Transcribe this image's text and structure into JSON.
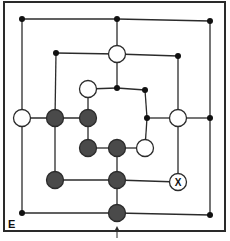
{
  "game": {
    "name": "Nine Men's Morris",
    "corner_label": "E",
    "colors": {
      "line": "#2b2b2b",
      "dark_piece": "#4a4a4a",
      "light_piece": "#ffffff",
      "dot": "#111111",
      "frame": "#2a2a2a"
    },
    "points": [
      {
        "id": "o-tl",
        "x": 22,
        "y": 19,
        "state": "dot"
      },
      {
        "id": "o-tm",
        "x": 117,
        "y": 19,
        "state": "dot"
      },
      {
        "id": "o-tr",
        "x": 210,
        "y": 21,
        "state": "dot"
      },
      {
        "id": "o-ml",
        "x": 22,
        "y": 118,
        "state": "white"
      },
      {
        "id": "o-mr",
        "x": 210,
        "y": 118,
        "state": "dot"
      },
      {
        "id": "o-bl",
        "x": 22,
        "y": 213,
        "state": "dot"
      },
      {
        "id": "o-bm",
        "x": 117,
        "y": 213,
        "state": "black"
      },
      {
        "id": "o-br",
        "x": 210,
        "y": 215,
        "state": "dot"
      },
      {
        "id": "m-tl",
        "x": 56,
        "y": 53,
        "state": "dot"
      },
      {
        "id": "m-tm",
        "x": 117,
        "y": 54,
        "state": "white"
      },
      {
        "id": "m-tr",
        "x": 178,
        "y": 56,
        "state": "dot"
      },
      {
        "id": "m-ml",
        "x": 55,
        "y": 118,
        "state": "black"
      },
      {
        "id": "m-mr",
        "x": 178,
        "y": 118,
        "state": "white"
      },
      {
        "id": "m-bl",
        "x": 55,
        "y": 180,
        "state": "black"
      },
      {
        "id": "m-bm",
        "x": 117,
        "y": 180,
        "state": "black"
      },
      {
        "id": "m-br",
        "x": 178,
        "y": 182,
        "state": "target",
        "mark": "X"
      },
      {
        "id": "i-tl",
        "x": 88,
        "y": 89,
        "state": "white"
      },
      {
        "id": "i-tm",
        "x": 117,
        "y": 88,
        "state": "dot"
      },
      {
        "id": "i-tr",
        "x": 145,
        "y": 90,
        "state": "dot"
      },
      {
        "id": "i-ml",
        "x": 88,
        "y": 118,
        "state": "black"
      },
      {
        "id": "i-mr",
        "x": 147,
        "y": 118,
        "state": "dot"
      },
      {
        "id": "i-bl",
        "x": 88,
        "y": 148,
        "state": "black"
      },
      {
        "id": "i-bm",
        "x": 117,
        "y": 148,
        "state": "black"
      },
      {
        "id": "i-br",
        "x": 145,
        "y": 148,
        "state": "white"
      }
    ],
    "lines": [
      [
        "o-tl",
        "o-tm"
      ],
      [
        "o-tm",
        "o-tr"
      ],
      [
        "o-tr",
        "o-mr"
      ],
      [
        "o-mr",
        "o-br"
      ],
      [
        "o-br",
        "o-bm"
      ],
      [
        "o-bm",
        "o-bl"
      ],
      [
        "o-bl",
        "o-ml"
      ],
      [
        "o-ml",
        "o-tl"
      ],
      [
        "m-tl",
        "m-tm"
      ],
      [
        "m-tm",
        "m-tr"
      ],
      [
        "m-tr",
        "m-mr"
      ],
      [
        "m-mr",
        "m-br"
      ],
      [
        "m-br",
        "m-bm"
      ],
      [
        "m-bm",
        "m-bl"
      ],
      [
        "m-bl",
        "m-ml"
      ],
      [
        "m-ml",
        "m-tl"
      ],
      [
        "i-tl",
        "i-tm"
      ],
      [
        "i-tm",
        "i-tr"
      ],
      [
        "i-tr",
        "i-mr"
      ],
      [
        "i-mr",
        "i-br"
      ],
      [
        "i-br",
        "i-bm"
      ],
      [
        "i-bm",
        "i-bl"
      ],
      [
        "i-bl",
        "i-ml"
      ],
      [
        "i-ml",
        "i-tl"
      ],
      [
        "o-tm",
        "m-tm"
      ],
      [
        "m-tm",
        "i-tm"
      ],
      [
        "o-ml",
        "m-ml"
      ],
      [
        "m-ml",
        "i-ml"
      ],
      [
        "o-mr",
        "m-mr"
      ],
      [
        "m-mr",
        "i-mr"
      ],
      [
        "o-bm",
        "m-bm"
      ],
      [
        "m-bm",
        "i-bm"
      ]
    ],
    "arrow": {
      "x": 117,
      "y1": 238,
      "y2": 226
    }
  }
}
